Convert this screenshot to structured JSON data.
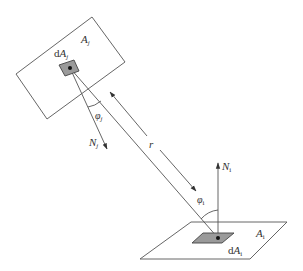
{
  "diagram": {
    "colors": {
      "line": "#555555",
      "patch_fill": "#9a9a9a",
      "text": "#333333",
      "background": "#ffffff"
    },
    "surface_j": {
      "label_main": "A",
      "label_sub": "j",
      "patch_label_prefix": "d",
      "patch_label_main": "A",
      "patch_label_sub": "j",
      "normal_label_main": "N",
      "normal_label_sub": "j",
      "angle_label_main": "φ",
      "angle_label_sub": "j"
    },
    "surface_i": {
      "label_main": "A",
      "label_sub": "i",
      "patch_label_prefix": "d",
      "patch_label_main": "A",
      "patch_label_sub": "i",
      "normal_label_main": "N",
      "normal_label_sub": "i",
      "angle_label_main": "φ",
      "angle_label_sub": "i"
    },
    "distance_label": "r"
  }
}
